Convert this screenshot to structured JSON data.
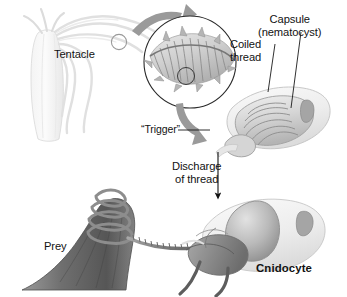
{
  "figure": {
    "background_color": "#ffffff",
    "text_color": "#121212",
    "arrow_color": "#8e8e8e",
    "leader_color": "#1a1a1a"
  },
  "labels": {
    "tentacle": "Tentacle",
    "coiled_thread": "Coiled\nthread",
    "capsule": "Capsule\n(nematocyst)",
    "trigger": "“Trigger”",
    "discharge": "Discharge\nof thread",
    "prey": "Prey",
    "cnidocyte": "Cnidocyte"
  },
  "icons": {
    "magnify_marker": "magnify-circle-icon",
    "zoom_arrow": "curved-arrow-icon",
    "return_arrow": "curved-arrow-icon",
    "discharge_arrow": "down-arrow-icon"
  }
}
